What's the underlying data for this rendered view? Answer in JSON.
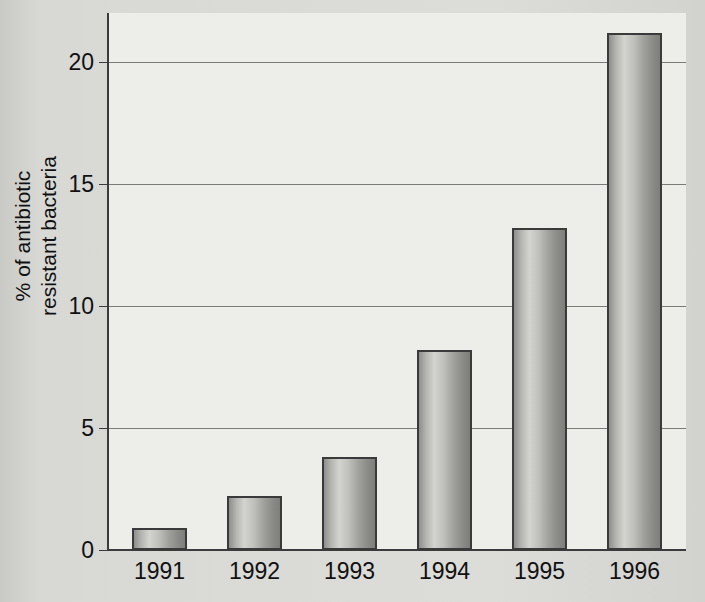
{
  "chart_data": {
    "type": "bar",
    "title": "",
    "subtitle": "",
    "xlabel": "",
    "ylabel_line1": "% of antibiotic",
    "ylabel_line2": "resistant bacteria",
    "ylabel": "% of antibiotic resistant bacteria",
    "categories": [
      "1991",
      "1992",
      "1993",
      "1994",
      "1995",
      "1996"
    ],
    "values": [
      0.9,
      2.2,
      3.8,
      8.2,
      13.2,
      21.2
    ],
    "ylim": [
      0,
      22
    ],
    "yticks": [
      0,
      5,
      10,
      15,
      20
    ],
    "ytick_labels": [
      "0",
      "5",
      "10",
      "15",
      "20"
    ],
    "grid": "horizontal",
    "legend": "none",
    "bar_style": "grayscale-gradient-cylinder",
    "colors": {
      "page_background": "#d8d8d5",
      "plot_background": "#ededea",
      "axis": "#3b3b3b",
      "gridline": "#7a7a78",
      "bar_border": "#3a3a3a",
      "bar_light": "#d3d3d0",
      "bar_dark": "#7e7e7b",
      "text": "#111111"
    }
  }
}
